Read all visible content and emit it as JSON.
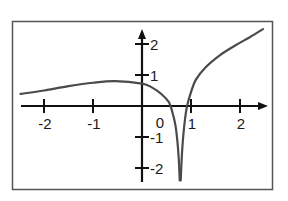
{
  "chart_data": {
    "type": "line",
    "title": "",
    "xlabel": "",
    "ylabel": "",
    "xlim": [
      -2.6,
      2.6
    ],
    "ylim": [
      -2.6,
      2.6
    ],
    "grid": false,
    "legend": null,
    "x_ticks": [
      -2,
      -1,
      1,
      2
    ],
    "x_tick_labels": [
      "-2",
      "-1",
      "1",
      "2"
    ],
    "y_ticks": [
      2,
      1,
      -1,
      -2
    ],
    "y_tick_labels": [
      "2",
      "1",
      "-1",
      "-2"
    ],
    "origin_label": "0",
    "vertical_asymptote_x": 0.78,
    "series": [
      {
        "name": "left branch",
        "x": [
          -2.48,
          -2.0,
          -1.5,
          -1.0,
          -0.55,
          0.0,
          0.2,
          0.4,
          0.55,
          0.62,
          0.68,
          0.72,
          0.75,
          0.77
        ],
        "y": [
          0.39,
          0.5,
          0.64,
          0.75,
          0.8,
          0.72,
          0.6,
          0.38,
          0.12,
          -0.2,
          -0.6,
          -1.1,
          -1.7,
          -2.4
        ]
      },
      {
        "name": "right branch",
        "x": [
          0.79,
          0.81,
          0.84,
          0.88,
          0.92,
          1.0,
          1.1,
          1.3,
          1.6,
          1.9,
          2.2,
          2.47
        ],
        "y": [
          -2.4,
          -1.7,
          -1.0,
          -0.4,
          0.0,
          0.45,
          0.85,
          1.25,
          1.65,
          1.95,
          2.22,
          2.48
        ]
      }
    ],
    "colors": {
      "curve": "#4a4a4a",
      "axes": "#111111",
      "frame": "#555555"
    }
  }
}
